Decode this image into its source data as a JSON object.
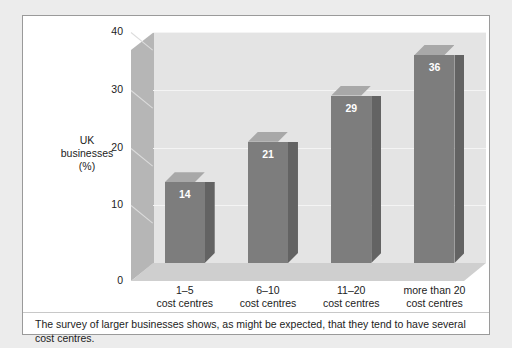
{
  "figure": {
    "caption": "The survey of larger businesses shows, as might be expected, that they tend to have several cost centres."
  },
  "axis": {
    "y_label_line1": "UK",
    "y_label_line2": "businesses",
    "y_label_line3": "(%)"
  },
  "colors": {
    "page_background": "#ececec",
    "figure_background": "#ffffff",
    "figure_border": "#9a9a9a",
    "back_wall": "#e4e4e4",
    "left_wall": "#b6b6b6",
    "floor": "#cfcfcf",
    "gridline": "#f4f4f4",
    "bar_front": "#7d7d7d",
    "bar_top": "#a8a8a8",
    "bar_side": "#636363",
    "value_label": "#ffffff",
    "text": "#1c1c1c"
  },
  "chart_data": {
    "type": "bar",
    "title": "",
    "subtitle": "",
    "xlabel": "",
    "ylabel": "UK businesses (%)",
    "ylim": [
      0,
      40
    ],
    "yticks": [
      0,
      10,
      20,
      30,
      40
    ],
    "ytick_labels": [
      "0",
      "10",
      "20",
      "30",
      "40"
    ],
    "grid": true,
    "legend": false,
    "three_d": true,
    "categories": [
      "1–5 cost centres",
      "6–10 cost centres",
      "11–20 cost centres",
      "more than 20 cost centres"
    ],
    "category_lines": [
      [
        "1–5",
        "cost centres"
      ],
      [
        "6–10",
        "cost centres"
      ],
      [
        "11–20",
        "cost centres"
      ],
      [
        "more than 20",
        "cost centres"
      ]
    ],
    "values": [
      14,
      21,
      29,
      36
    ],
    "value_labels": [
      "14",
      "21",
      "29",
      "36"
    ],
    "units": "%"
  }
}
